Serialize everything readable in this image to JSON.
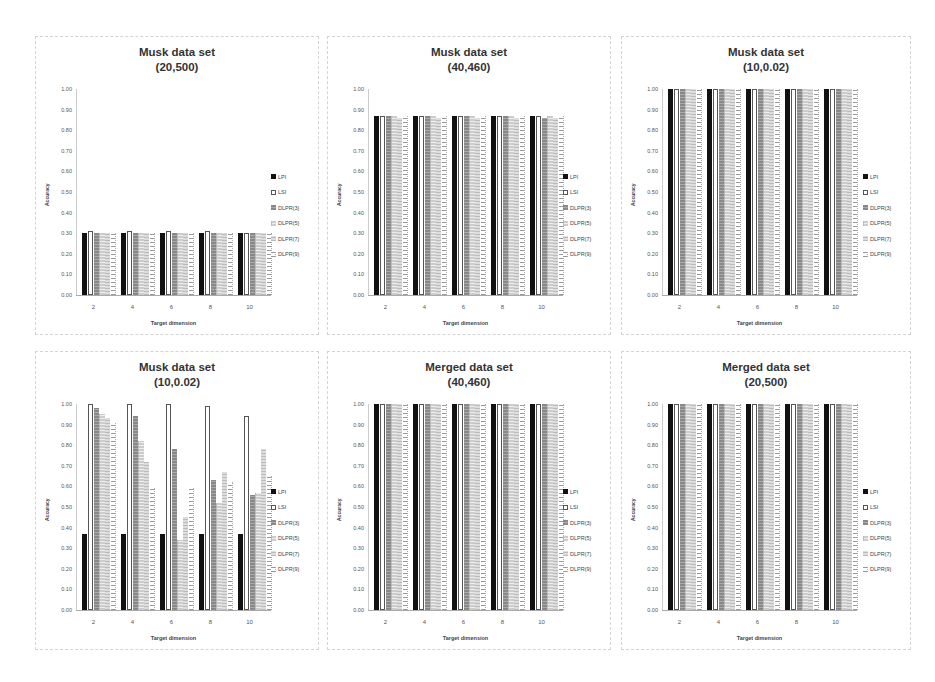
{
  "legend_labels": [
    "LPI",
    "LSI",
    "DLPR(3)",
    "DLPR(5)",
    "DLPR(7)",
    "DLPR(9)"
  ],
  "chart_data": [
    {
      "type": "bar",
      "title": "Musk data set",
      "subtitle": "(20,500)",
      "xlabel": "Target dimension",
      "ylabel": "Accuracy",
      "ylim": [
        0,
        1
      ],
      "yticks": [
        "0.00",
        "0.10",
        "0.20",
        "0.30",
        "0.40",
        "0.50",
        "0.60",
        "0.70",
        "0.80",
        "0.90",
        "1.00"
      ],
      "categories": [
        "2",
        "4",
        "6",
        "8",
        "10"
      ],
      "legend_position": "right",
      "grid": false,
      "series": [
        {
          "name": "LPI",
          "values": [
            0.3,
            0.3,
            0.3,
            0.3,
            0.3
          ]
        },
        {
          "name": "LSI",
          "values": [
            0.31,
            0.31,
            0.31,
            0.31,
            0.3
          ]
        },
        {
          "name": "DLPR(3)",
          "values": [
            0.3,
            0.3,
            0.3,
            0.3,
            0.3
          ]
        },
        {
          "name": "DLPR(5)",
          "values": [
            0.3,
            0.3,
            0.3,
            0.3,
            0.3
          ]
        },
        {
          "name": "DLPR(7)",
          "values": [
            0.3,
            0.3,
            0.3,
            0.3,
            0.3
          ]
        },
        {
          "name": "DLPR(9)",
          "values": [
            0.3,
            0.3,
            0.3,
            0.3,
            0.3
          ]
        }
      ]
    },
    {
      "type": "bar",
      "title": "Musk data set",
      "subtitle": "(40,460)",
      "xlabel": "Target dimension",
      "ylabel": "Accuracy",
      "ylim": [
        0,
        1
      ],
      "yticks": [
        "0.00",
        "0.10",
        "0.20",
        "0.30",
        "0.40",
        "0.50",
        "0.60",
        "0.70",
        "0.80",
        "0.90",
        "1.00"
      ],
      "categories": [
        "2",
        "4",
        "6",
        "8",
        "10"
      ],
      "legend_position": "right",
      "grid": false,
      "series": [
        {
          "name": "LPI",
          "values": [
            0.87,
            0.87,
            0.87,
            0.87,
            0.87
          ]
        },
        {
          "name": "LSI",
          "values": [
            0.87,
            0.87,
            0.87,
            0.87,
            0.87
          ]
        },
        {
          "name": "DLPR(3)",
          "values": [
            0.87,
            0.87,
            0.87,
            0.87,
            0.86
          ]
        },
        {
          "name": "DLPR(5)",
          "values": [
            0.87,
            0.87,
            0.87,
            0.87,
            0.87
          ]
        },
        {
          "name": "DLPR(7)",
          "values": [
            0.86,
            0.86,
            0.86,
            0.86,
            0.86
          ]
        },
        {
          "name": "DLPR(9)",
          "values": [
            0.87,
            0.87,
            0.87,
            0.87,
            0.87
          ]
        }
      ]
    },
    {
      "type": "bar",
      "title": "Musk data set",
      "subtitle": "(10,0.02)",
      "xlabel": "Target dimension",
      "ylabel": "Accuracy",
      "ylim": [
        0,
        1
      ],
      "yticks": [
        "0.00",
        "0.10",
        "0.20",
        "0.30",
        "0.40",
        "0.50",
        "0.60",
        "0.70",
        "0.80",
        "0.90",
        "1.00"
      ],
      "categories": [
        "2",
        "4",
        "6",
        "8",
        "10"
      ],
      "legend_position": "right",
      "grid": false,
      "series": [
        {
          "name": "LPI",
          "values": [
            1.0,
            1.0,
            1.0,
            1.0,
            1.0
          ]
        },
        {
          "name": "LSI",
          "values": [
            1.0,
            1.0,
            1.0,
            1.0,
            1.0
          ]
        },
        {
          "name": "DLPR(3)",
          "values": [
            1.0,
            1.0,
            1.0,
            1.0,
            1.0
          ]
        },
        {
          "name": "DLPR(5)",
          "values": [
            1.0,
            1.0,
            1.0,
            1.0,
            1.0
          ]
        },
        {
          "name": "DLPR(7)",
          "values": [
            1.0,
            1.0,
            1.0,
            1.0,
            1.0
          ]
        },
        {
          "name": "DLPR(9)",
          "values": [
            1.0,
            1.0,
            1.0,
            1.0,
            1.0
          ]
        }
      ]
    },
    {
      "type": "bar",
      "title": "Musk data set",
      "subtitle": "(10,0.02)",
      "xlabel": "Target dimension",
      "ylabel": "Accuracy",
      "ylim": [
        0,
        1
      ],
      "yticks": [
        "0.00",
        "0.10",
        "0.20",
        "0.30",
        "0.40",
        "0.50",
        "0.60",
        "0.70",
        "0.80",
        "0.90",
        "1.00"
      ],
      "categories": [
        "2",
        "4",
        "6",
        "8",
        "10"
      ],
      "legend_position": "right",
      "grid": false,
      "series": [
        {
          "name": "LPI",
          "values": [
            0.37,
            0.37,
            0.37,
            0.37,
            0.37
          ]
        },
        {
          "name": "LSI",
          "values": [
            1.0,
            1.0,
            1.0,
            0.99,
            0.94
          ]
        },
        {
          "name": "DLPR(3)",
          "values": [
            0.98,
            0.94,
            0.78,
            0.63,
            0.56
          ]
        },
        {
          "name": "DLPR(5)",
          "values": [
            0.95,
            0.82,
            0.34,
            0.52,
            0.57
          ]
        },
        {
          "name": "DLPR(7)",
          "values": [
            0.93,
            0.72,
            0.45,
            0.67,
            0.78
          ]
        },
        {
          "name": "DLPR(9)",
          "values": [
            0.91,
            0.59,
            0.59,
            0.62,
            0.65
          ]
        }
      ]
    },
    {
      "type": "bar",
      "title": "Merged data set",
      "subtitle": "(40,460)",
      "xlabel": "Target dimension",
      "ylabel": "Accuracy",
      "ylim": [
        0,
        1
      ],
      "yticks": [
        "0.00",
        "0.10",
        "0.20",
        "0.30",
        "0.40",
        "0.50",
        "0.60",
        "0.70",
        "0.80",
        "0.90",
        "1.00"
      ],
      "categories": [
        "2",
        "4",
        "6",
        "8",
        "10"
      ],
      "legend_position": "right",
      "grid": false,
      "series": [
        {
          "name": "LPI",
          "values": [
            1.0,
            1.0,
            1.0,
            1.0,
            1.0
          ]
        },
        {
          "name": "LSI",
          "values": [
            1.0,
            1.0,
            1.0,
            1.0,
            1.0
          ]
        },
        {
          "name": "DLPR(3)",
          "values": [
            1.0,
            1.0,
            1.0,
            1.0,
            1.0
          ]
        },
        {
          "name": "DLPR(5)",
          "values": [
            1.0,
            1.0,
            1.0,
            1.0,
            1.0
          ]
        },
        {
          "name": "DLPR(7)",
          "values": [
            1.0,
            1.0,
            1.0,
            1.0,
            1.0
          ]
        },
        {
          "name": "DLPR(9)",
          "values": [
            1.0,
            1.0,
            1.0,
            1.0,
            1.0
          ]
        }
      ]
    },
    {
      "type": "bar",
      "title": "Merged data set",
      "subtitle": "(20,500)",
      "xlabel": "Target dimension",
      "ylabel": "Accuracy",
      "ylim": [
        0,
        1
      ],
      "yticks": [
        "0.00",
        "0.10",
        "0.20",
        "0.30",
        "0.40",
        "0.50",
        "0.60",
        "0.70",
        "0.80",
        "0.90",
        "1.00"
      ],
      "categories": [
        "2",
        "4",
        "6",
        "8",
        "10"
      ],
      "legend_position": "right",
      "grid": false,
      "series": [
        {
          "name": "LPI",
          "values": [
            1.0,
            1.0,
            1.0,
            1.0,
            1.0
          ]
        },
        {
          "name": "LSI",
          "values": [
            1.0,
            1.0,
            1.0,
            1.0,
            1.0
          ]
        },
        {
          "name": "DLPR(3)",
          "values": [
            1.0,
            1.0,
            1.0,
            1.0,
            1.0
          ]
        },
        {
          "name": "DLPR(5)",
          "values": [
            1.0,
            1.0,
            1.0,
            1.0,
            1.0
          ]
        },
        {
          "name": "DLPR(7)",
          "values": [
            1.0,
            1.0,
            1.0,
            1.0,
            1.0
          ]
        },
        {
          "name": "DLPR(9)",
          "values": [
            1.0,
            1.0,
            1.0,
            1.0,
            1.0
          ]
        }
      ]
    }
  ]
}
